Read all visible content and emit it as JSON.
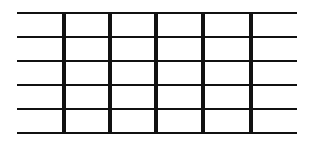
{
  "diagram": {
    "type": "grid",
    "colors": {
      "background": "#ffffff",
      "line": "#111111"
    },
    "horizontal_lines": {
      "count": 6,
      "x_start": 17,
      "x_end": 297,
      "y_positions": [
        12,
        36,
        60,
        84,
        108,
        132
      ],
      "thickness": 2
    },
    "vertical_lines": {
      "count": 5,
      "x_positions": [
        62,
        108,
        154,
        201,
        249
      ],
      "y_start": 12,
      "y_end": 133,
      "thickness": 4
    }
  }
}
